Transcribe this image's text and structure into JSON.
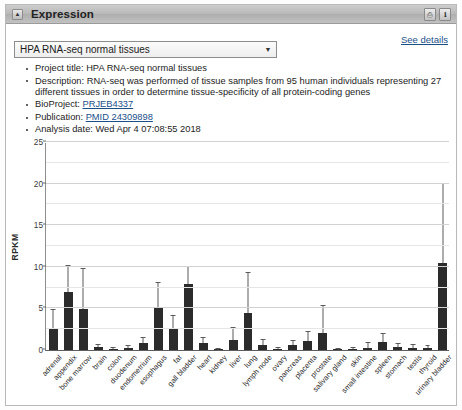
{
  "panel": {
    "title": "Expression",
    "collapse_icon": "triangle-up-icon",
    "header_buttons": [
      {
        "name": "print-button",
        "glyph": "⎙"
      },
      {
        "name": "info-button",
        "glyph": "ℹ"
      }
    ],
    "see_details_label": "See details"
  },
  "dataset_select": {
    "value": "HPA RNA-seq normal tissues",
    "arrow_icon": "chevron-down-icon",
    "options": [
      "HPA RNA-seq normal tissues"
    ]
  },
  "info_items": [
    {
      "prefix": "Project title: ",
      "text": "HPA RNA-seq normal tissues",
      "link": null,
      "suffix": ""
    },
    {
      "prefix": "Description: ",
      "text": "RNA-seq was performed of tissue samples from 95 human individuals representing 27 different tissues in order to determine tissue-specificity of all protein-coding genes",
      "link": null,
      "suffix": ""
    },
    {
      "prefix": "BioProject: ",
      "text": "",
      "link": "PRJEB4337",
      "suffix": ""
    },
    {
      "prefix": "Publication: ",
      "text": "",
      "link": "PMID 24309898",
      "suffix": ""
    },
    {
      "prefix": "Analysis date: ",
      "text": "Wed Apr 4 07:08:55 2018",
      "link": null,
      "suffix": ""
    }
  ],
  "chart_data": {
    "type": "bar",
    "title": "",
    "xlabel": "",
    "ylabel": "RPKM",
    "ylim": [
      0,
      25
    ],
    "yticks": [
      0,
      5,
      10,
      15,
      20,
      25
    ],
    "minor_yticks": [
      2.5,
      7.5,
      12.5,
      17.5,
      22.5
    ],
    "grid": true,
    "legend": null,
    "error_bars": "standard deviation",
    "categories": [
      "adrenal",
      "appendix",
      "bone marrow",
      "brain",
      "colon",
      "duodenum",
      "endometrium",
      "esophagus",
      "fat",
      "gall bladder",
      "heart",
      "kidney",
      "liver",
      "lung",
      "lymph node",
      "ovary",
      "pancreas",
      "placenta",
      "prostate",
      "salivary gland",
      "skin",
      "small intestine",
      "spleen",
      "stomach",
      "testis",
      "thyroid",
      "urinary bladder"
    ],
    "values": [
      2.7,
      7.0,
      4.9,
      0.4,
      0.15,
      0.25,
      0.8,
      5.2,
      2.5,
      7.9,
      0.8,
      0.1,
      1.2,
      4.4,
      0.6,
      0.15,
      0.6,
      1.1,
      2.1,
      0.05,
      0.1,
      0.3,
      1.0,
      0.35,
      0.3,
      0.25,
      10.4
    ],
    "errors": [
      2.1,
      3.1,
      4.8,
      0.25,
      0.1,
      0.2,
      0.7,
      2.9,
      1.6,
      2.1,
      0.6,
      0.05,
      1.4,
      4.9,
      0.6,
      0.1,
      0.5,
      1.1,
      3.2,
      0.05,
      0.1,
      0.5,
      0.9,
      0.4,
      0.3,
      0.2,
      9.6
    ]
  }
}
